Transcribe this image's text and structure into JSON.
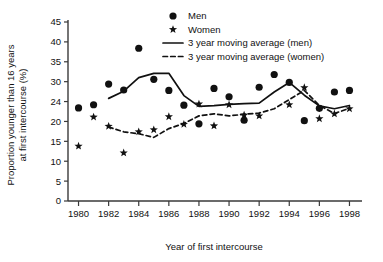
{
  "chart_data": {
    "type": "scatter",
    "title": "",
    "xlabel": "Year of first intercourse",
    "ylabel": "Proportion younger than 16 years at first intercourse (%)",
    "xlim": [
      1979.3,
      1998.7
    ],
    "ylim": [
      0,
      45
    ],
    "grid": false,
    "legend_position": "top-right",
    "x_ticks": [
      1980,
      1982,
      1984,
      1986,
      1988,
      1990,
      1992,
      1994,
      1996,
      1998
    ],
    "x_tick_labels": [
      "1980",
      "1982",
      "1984",
      "1986",
      "1988",
      "1990",
      "1992",
      "1994",
      "1996",
      "1998"
    ],
    "y_ticks": [
      0,
      5,
      10,
      15,
      20,
      24,
      30,
      35,
      40,
      45
    ],
    "y_tick_labels": [
      "0",
      "5",
      "10",
      "15",
      "20",
      "24",
      "30",
      "35",
      "40",
      "45"
    ],
    "x": [
      1980,
      1981,
      1982,
      1983,
      1984,
      1985,
      1986,
      1987,
      1988,
      1989,
      1990,
      1991,
      1992,
      1993,
      1994,
      1995,
      1996,
      1997,
      1998
    ],
    "series": [
      {
        "name": "Men",
        "marker": "circle",
        "values": [
          23.4,
          24.2,
          29.4,
          27.9,
          38.4,
          30.6,
          27.8,
          24.1,
          19.4,
          28.3,
          26.2,
          20.3,
          28.6,
          31.8,
          29.8,
          20.2,
          23.3,
          27.4,
          27.8
        ]
      },
      {
        "name": "Women",
        "marker": "star",
        "values": [
          13.8,
          21.1,
          18.8,
          12.1,
          17.4,
          17.9,
          21.2,
          19.3,
          24.4,
          18.9,
          24.2,
          21.6,
          21.4,
          null,
          24.2,
          28.5,
          20.7,
          21.9,
          23.2
        ]
      },
      {
        "name": "3 year moving average (men)",
        "marker": "line",
        "x": [
          1982,
          1983,
          1984,
          1985,
          1986,
          1987,
          1988,
          1989,
          1990,
          1991,
          1992,
          1993,
          1994,
          1995,
          1996,
          1997,
          1998
        ],
        "values": [
          25.8,
          27.6,
          31.0,
          32.1,
          32.1,
          26.5,
          23.8,
          24.0,
          24.3,
          24.5,
          24.6,
          27.4,
          29.8,
          26.6,
          23.9,
          23.2,
          24.0
        ]
      },
      {
        "name": "3 year moving average (women)",
        "marker": "dashed-line",
        "x": [
          1982,
          1983,
          1984,
          1985,
          1986,
          1987,
          1988,
          1989,
          1990,
          1991,
          1992,
          1993,
          1994,
          1995,
          1996,
          1997,
          1998
        ],
        "values": [
          18.6,
          17.4,
          16.9,
          16.0,
          18.2,
          19.5,
          21.4,
          21.9,
          21.4,
          21.8,
          22.1,
          23.2,
          25.5,
          27.8,
          24.0,
          22.0,
          23.3
        ]
      }
    ]
  },
  "legend": {
    "items": [
      {
        "label": "Men",
        "glyph": "circle-marker"
      },
      {
        "label": "Women",
        "glyph": "star-marker"
      },
      {
        "label": "3 year moving average (men)",
        "glyph": "solid-line"
      },
      {
        "label": "3 year moving average (women)",
        "glyph": "dashed-line"
      }
    ]
  },
  "axes": {
    "y_title_line1": "Proportion younger than 16 years",
    "y_title_line2": "at first intercourse (%)",
    "x_title": "Year of first intercourse"
  },
  "colors": {
    "ink": "#111111",
    "axis": "#3a3a3a",
    "background": "#ffffff"
  }
}
